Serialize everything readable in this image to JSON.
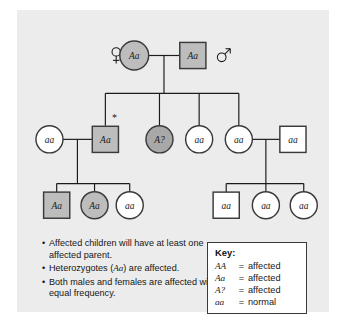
{
  "figure": {
    "background_color": "#ececec"
  },
  "pedigree": {
    "colors": {
      "affected_fill": "#bdbdbd",
      "affected_dark_fill": "#a8a8a8",
      "normal_fill": "#ffffff",
      "stroke": "#3a3a3a",
      "line": "#1b1b1b"
    },
    "gender_markers": [
      {
        "name": "female-symbol",
        "glyph": "♀",
        "x": 110,
        "y": 32
      },
      {
        "name": "male-symbol",
        "glyph": "♂",
        "x": 229,
        "y": 28
      }
    ],
    "generations": [
      {
        "id": "generation-1",
        "individuals": [
          {
            "id": "I-1",
            "shape": "circle",
            "sex": "female",
            "genotype": "Aa",
            "status": "affected",
            "cx": 130,
            "cy": 34,
            "r": 16
          },
          {
            "id": "I-2",
            "shape": "square",
            "sex": "male",
            "genotype": "Aa",
            "status": "affected",
            "cx": 195,
            "cy": 34,
            "size": 29
          }
        ]
      },
      {
        "id": "generation-2",
        "individuals": [
          {
            "id": "II-1",
            "shape": "circle",
            "sex": "female",
            "genotype": "aa",
            "status": "normal",
            "cx": 36,
            "cy": 127,
            "r": 15
          },
          {
            "id": "II-2",
            "shape": "square",
            "sex": "male",
            "genotype": "Aa",
            "status": "affected",
            "cx": 98,
            "cy": 127,
            "size": 29,
            "marked": true,
            "marker": "*"
          },
          {
            "id": "II-3",
            "shape": "circle",
            "sex": "female",
            "genotype": "A?",
            "status": "affected",
            "cx": 158,
            "cy": 127,
            "r": 15,
            "shade": "dark"
          },
          {
            "id": "II-4",
            "shape": "circle",
            "sex": "female",
            "genotype": "aa",
            "status": "normal",
            "cx": 202,
            "cy": 127,
            "r": 15
          },
          {
            "id": "II-5",
            "shape": "circle",
            "sex": "female",
            "genotype": "aa",
            "status": "normal",
            "cx": 246,
            "cy": 127,
            "r": 15
          },
          {
            "id": "II-6",
            "shape": "square",
            "sex": "male",
            "genotype": "aa",
            "status": "normal",
            "cx": 306,
            "cy": 127,
            "size": 29
          }
        ]
      },
      {
        "id": "generation-3",
        "individuals": [
          {
            "id": "III-1",
            "shape": "square",
            "sex": "male",
            "genotype": "Aa",
            "status": "affected",
            "cx": 44,
            "cy": 200,
            "size": 29
          },
          {
            "id": "III-2",
            "shape": "circle",
            "sex": "female",
            "genotype": "Aa",
            "status": "affected",
            "cx": 86,
            "cy": 200,
            "r": 15
          },
          {
            "id": "III-3",
            "shape": "circle",
            "sex": "female",
            "genotype": "aa",
            "status": "normal",
            "cx": 125,
            "cy": 200,
            "r": 15
          },
          {
            "id": "III-4",
            "shape": "square",
            "sex": "male",
            "genotype": "aa",
            "status": "normal",
            "cx": 232,
            "cy": 200,
            "size": 29
          },
          {
            "id": "III-5",
            "shape": "circle",
            "sex": "female",
            "genotype": "aa",
            "status": "normal",
            "cx": 276,
            "cy": 200,
            "r": 15
          },
          {
            "id": "III-6",
            "shape": "circle",
            "sex": "female",
            "genotype": "aa",
            "status": "normal",
            "cx": 318,
            "cy": 200,
            "r": 15
          }
        ]
      }
    ]
  },
  "notes": {
    "bullet": "•",
    "items": [
      "Affected children will have at least one affected parent.",
      "Heterozygotes (Aa) are affected.",
      "Both males and females are affected with equal frequency."
    ]
  },
  "key": {
    "title": "Key:",
    "equals": "=",
    "rows": [
      {
        "genotype": "AA",
        "phenotype": "affected"
      },
      {
        "genotype": "Aa",
        "phenotype": "affected"
      },
      {
        "genotype": "A?",
        "phenotype": "affected"
      },
      {
        "genotype": "aa",
        "phenotype": "normal"
      }
    ]
  }
}
